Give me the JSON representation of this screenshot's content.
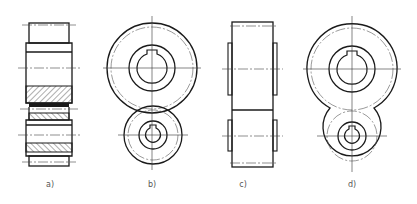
{
  "figure": {
    "stroke_color": "#1a1a1a",
    "thin_color": "#333333",
    "labels": [
      {
        "id": "a",
        "text": "a)",
        "x": 50,
        "y": 180
      },
      {
        "id": "b",
        "text": "b)",
        "x": 152,
        "y": 180
      },
      {
        "id": "c",
        "text": "c)",
        "x": 243,
        "y": 180
      },
      {
        "id": "d",
        "text": "d)",
        "x": 352,
        "y": 180
      }
    ]
  }
}
